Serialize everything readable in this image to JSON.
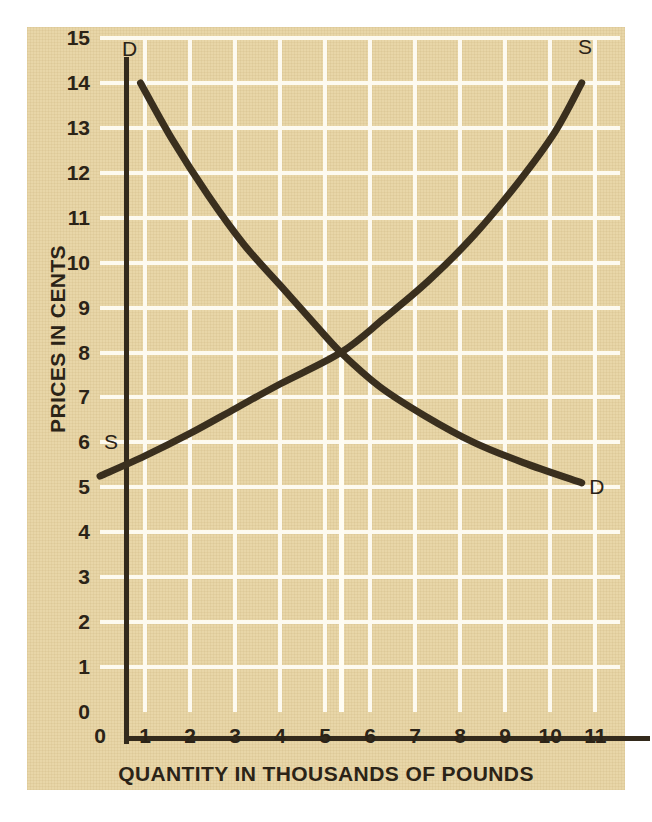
{
  "chart_data": {
    "type": "line",
    "title": "",
    "subtitle": "",
    "xlabel": "QUANTITY IN THOUSANDS OF POUNDS",
    "ylabel": "PRICES IN CENTS",
    "xlim": [
      0,
      11.55
    ],
    "ylim": [
      0,
      15
    ],
    "xticks": [
      "0",
      "1",
      "2",
      "3",
      "4",
      "5",
      "6",
      "7",
      "8",
      "9",
      "10",
      "11"
    ],
    "yticks": [
      "0",
      "1",
      "2",
      "3",
      "4",
      "5",
      "6",
      "7",
      "8",
      "9",
      "10",
      "11",
      "12",
      "13",
      "14",
      "15"
    ],
    "grid": true,
    "legend": "inline-endpoint-labels",
    "series": [
      {
        "name": "D",
        "label": "Demand",
        "start_label": "D",
        "end_label": "D",
        "color": "#3a2f1e",
        "points": [
          {
            "x": 0.9,
            "y": 14.0
          },
          {
            "x": 1.6,
            "y": 12.75
          },
          {
            "x": 2.4,
            "y": 11.5
          },
          {
            "x": 3.2,
            "y": 10.4
          },
          {
            "x": 4.0,
            "y": 9.5
          },
          {
            "x": 4.8,
            "y": 8.6
          },
          {
            "x": 5.35,
            "y": 8.0
          },
          {
            "x": 6.2,
            "y": 7.25
          },
          {
            "x": 7.2,
            "y": 6.6
          },
          {
            "x": 8.3,
            "y": 6.0
          },
          {
            "x": 9.4,
            "y": 5.55
          },
          {
            "x": 10.7,
            "y": 5.1
          }
        ]
      },
      {
        "name": "S",
        "label": "Supply",
        "start_label": "S",
        "end_label": "S",
        "color": "#3a2f1e",
        "points": [
          {
            "x": 0.0,
            "y": 5.25
          },
          {
            "x": 1.0,
            "y": 5.7
          },
          {
            "x": 2.0,
            "y": 6.2
          },
          {
            "x": 3.0,
            "y": 6.75
          },
          {
            "x": 4.0,
            "y": 7.3
          },
          {
            "x": 5.35,
            "y": 8.0
          },
          {
            "x": 6.3,
            "y": 8.75
          },
          {
            "x": 7.3,
            "y": 9.6
          },
          {
            "x": 8.3,
            "y": 10.6
          },
          {
            "x": 9.3,
            "y": 11.8
          },
          {
            "x": 10.1,
            "y": 12.9
          },
          {
            "x": 10.7,
            "y": 14.0
          }
        ]
      }
    ],
    "equilibrium": {
      "x": 5.35,
      "y": 8.0,
      "marker": "vertical-guide-line"
    },
    "annotations": [
      {
        "text": "D",
        "x": 0.62,
        "y": 14.75,
        "name": "demand-top-label"
      },
      {
        "text": "D",
        "x": 11.0,
        "y": 5.0,
        "name": "demand-bottom-label"
      },
      {
        "text": "S",
        "x": 0.22,
        "y": 6.0,
        "name": "supply-bottom-label"
      },
      {
        "text": "S",
        "x": 10.75,
        "y": 14.8,
        "name": "supply-top-label"
      }
    ],
    "colors": {
      "paper": "#e8d6a8",
      "grid": "#fdfaf0",
      "axis": "#332a1c",
      "curve": "#3a2f1e",
      "text": "#2b2317",
      "page": "#ffffff"
    }
  }
}
